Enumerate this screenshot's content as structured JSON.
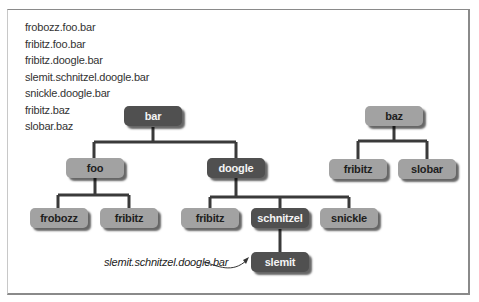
{
  "path_list": [
    "frobozz.foo.bar",
    "fribitz.foo.bar",
    "fribitz.doogle.bar",
    "slemit.schnitzel.doogle.bar",
    "snickle.doogle.bar",
    "fribitz.baz",
    "slobar.baz"
  ],
  "nodes": {
    "bar": {
      "label": "bar",
      "style": "dark"
    },
    "foo": {
      "label": "foo",
      "style": "light"
    },
    "doogle": {
      "label": "doogle",
      "style": "dark"
    },
    "frobozz": {
      "label": "frobozz",
      "style": "light"
    },
    "fribitz_foo": {
      "label": "fribitz",
      "style": "light"
    },
    "fribitz_doogle": {
      "label": "fribitz",
      "style": "light"
    },
    "schnitzel": {
      "label": "schnitzel",
      "style": "dark"
    },
    "snickle": {
      "label": "snickle",
      "style": "light"
    },
    "slemit": {
      "label": "slemit",
      "style": "dark"
    },
    "baz": {
      "label": "baz",
      "style": "light"
    },
    "fribitz_baz": {
      "label": "fribitz",
      "style": "light"
    },
    "slobar": {
      "label": "slobar",
      "style": "light"
    }
  },
  "edges": [
    [
      "bar",
      "foo"
    ],
    [
      "bar",
      "doogle"
    ],
    [
      "foo",
      "frobozz"
    ],
    [
      "foo",
      "fribitz_foo"
    ],
    [
      "doogle",
      "fribitz_doogle"
    ],
    [
      "doogle",
      "schnitzel"
    ],
    [
      "doogle",
      "snickle"
    ],
    [
      "schnitzel",
      "slemit"
    ],
    [
      "baz",
      "fribitz_baz"
    ],
    [
      "baz",
      "slobar"
    ]
  ],
  "annotation": {
    "text": "slemit.schnitzel.doogle.bar",
    "points_to": "slemit"
  },
  "colors": {
    "dark_node": "#505050",
    "light_node": "#a2a2a2",
    "connector": "#3a3a3a"
  }
}
